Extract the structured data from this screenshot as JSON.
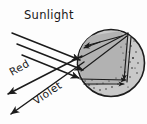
{
  "figure": {
    "canvas": {
      "width": 147,
      "height": 124,
      "background": "#fdfdfd"
    },
    "labels": {
      "sunlight": "Sunlight",
      "red": "Red",
      "violet": "Violet"
    },
    "colors": {
      "ink": "#1b1b1b",
      "drop_outer_fill": "#c9c9c9",
      "drop_inner_fill": "#b2b2b2",
      "speckle": "#232323",
      "background": "#fdfdfd"
    },
    "raindrop": {
      "shape": "circle",
      "center_x": 111,
      "center_y": 63,
      "radius": 34,
      "speckle_count": 34
    },
    "incoming_rays": {
      "name": "Sunlight",
      "count": 3,
      "direction": "down-right",
      "arrowheads": 3
    },
    "outgoing_rays": [
      {
        "name": "Red",
        "direction": "down-left",
        "arrowhead": true
      },
      {
        "name": "Violet",
        "direction": "down-left",
        "arrowhead": true
      }
    ],
    "internal_rays": {
      "description": "refracted and internally reflected paths inside the drop",
      "segment_count": 6,
      "arrowheads": 5
    }
  }
}
